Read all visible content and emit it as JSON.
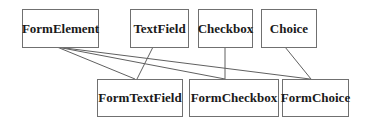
{
  "diagram": {
    "type": "class-hierarchy",
    "colors": {
      "border": "#707070",
      "edge": "#606060",
      "text": "#1a1a1a",
      "background": "#ffffff"
    },
    "nodes": [
      {
        "id": "FormElement",
        "label": "FormElement",
        "row": "top"
      },
      {
        "id": "TextField",
        "label": "TextField",
        "row": "top"
      },
      {
        "id": "Checkbox",
        "label": "Checkbox",
        "row": "top"
      },
      {
        "id": "Choice",
        "label": "Choice",
        "row": "top"
      },
      {
        "id": "FormTextField",
        "label": "FormTextField",
        "row": "bottom"
      },
      {
        "id": "FormCheckbox",
        "label": "FormCheckbox",
        "row": "bottom"
      },
      {
        "id": "FormChoice",
        "label": "FormChoice",
        "row": "bottom"
      }
    ],
    "edges": [
      {
        "from": "FormElement",
        "to": "FormTextField"
      },
      {
        "from": "FormElement",
        "to": "FormCheckbox"
      },
      {
        "from": "FormElement",
        "to": "FormChoice"
      },
      {
        "from": "TextField",
        "to": "FormTextField"
      },
      {
        "from": "Checkbox",
        "to": "FormCheckbox"
      },
      {
        "from": "Choice",
        "to": "FormChoice"
      }
    ]
  }
}
